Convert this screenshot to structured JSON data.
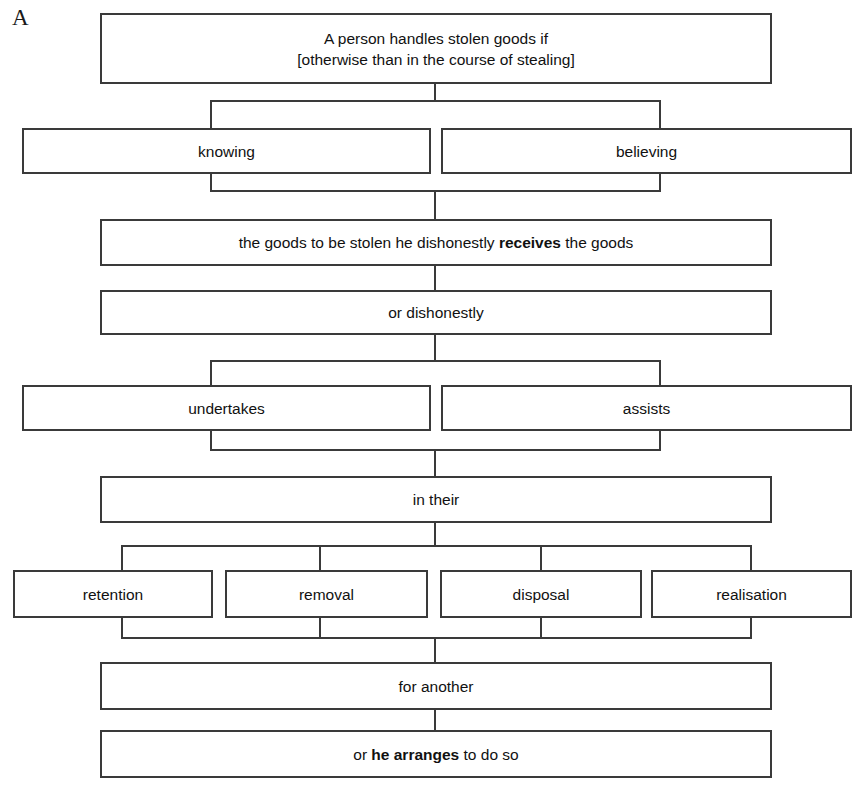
{
  "figure": {
    "panel_label": "A",
    "background_color": "#ffffff",
    "line_color": "#3a3a3a",
    "text_color": "#111111"
  },
  "nodes": {
    "root": {
      "line1": "A person handles stolen goods if",
      "line2": "[otherwise than in the course of stealing]"
    },
    "knowing": {
      "label": "knowing"
    },
    "believing": {
      "label": "believing"
    },
    "receives": {
      "prefix": "the goods to be stolen he dishonestly ",
      "bold": "receives",
      "suffix": " the goods"
    },
    "or_dishonestly": {
      "label": "or dishonestly"
    },
    "undertakes": {
      "label": "undertakes"
    },
    "assists": {
      "label": "assists"
    },
    "in_their": {
      "label": "in their"
    },
    "retention": {
      "label": "retention"
    },
    "removal": {
      "label": "removal"
    },
    "disposal": {
      "label": "disposal"
    },
    "realisation": {
      "label": "realisation"
    },
    "for_another": {
      "label": "for another"
    },
    "arranges": {
      "prefix": "or ",
      "bold": "he arranges",
      "suffix": " to do so"
    }
  },
  "flow": {
    "levels": [
      [
        "root"
      ],
      [
        "knowing",
        "believing"
      ],
      [
        "receives"
      ],
      [
        "or_dishonestly"
      ],
      [
        "undertakes",
        "assists"
      ],
      [
        "in_their"
      ],
      [
        "retention",
        "removal",
        "disposal",
        "realisation"
      ],
      [
        "for_another"
      ],
      [
        "arranges"
      ]
    ]
  }
}
